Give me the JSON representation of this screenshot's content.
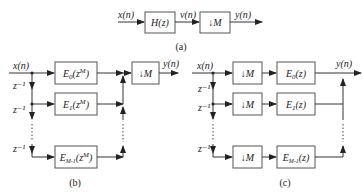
{
  "panel_a": {
    "input_label": "x(n)",
    "filter_label": "H(z)",
    "mid_label": "v(n)",
    "down_label": "↓M",
    "output_label": "y(n)",
    "caption": "(a)"
  },
  "panel_b": {
    "input_label": "x(n)",
    "delay_labels": [
      "z⁻¹",
      "z⁻¹",
      "z⁻¹"
    ],
    "branch_base": "E",
    "branches": [
      {
        "sub": "0",
        "arg": "(z",
        "sup": "M",
        "close": ")"
      },
      {
        "sub": "1",
        "arg": "(z",
        "sup": "M",
        "close": ")"
      },
      {
        "sub": "M-1",
        "arg": "(z",
        "sup": "M",
        "close": ")"
      }
    ],
    "down_label": "↓M",
    "output_label": "y(n)",
    "caption": "(b)"
  },
  "panel_c": {
    "input_label": "x(n)",
    "delay_labels": [
      "z⁻¹",
      "z⁻¹",
      "z⁻¹"
    ],
    "down_label": "↓M",
    "branch_base": "E",
    "branches": [
      {
        "sub": "0",
        "arg": "(z)"
      },
      {
        "sub": "1",
        "arg": "(z)"
      },
      {
        "sub": "M-1",
        "arg": "(z)"
      }
    ],
    "output_label": "y(n)",
    "caption": "(c)"
  },
  "colors": {
    "line": "#333333",
    "box_border": "#555555",
    "background": "#ffffff"
  }
}
